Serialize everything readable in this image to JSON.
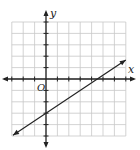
{
  "graph": {
    "x_axis_label": "x",
    "y_axis_label": "y",
    "origin_label": "O",
    "x_range": [
      -3,
      7
    ],
    "y_range": [
      -5,
      5
    ],
    "grid_unit": 1,
    "line": {
      "equation": "y = (2/3)x - 3",
      "slope": 0.6667,
      "y_intercept": -3,
      "x_intercept": 4.5,
      "start": [
        -2.9,
        -4.93
      ],
      "end": [
        7,
        1.67
      ]
    }
  },
  "chart_data": {
    "type": "line",
    "title": "",
    "xlabel": "x",
    "ylabel": "y",
    "xlim": [
      -3,
      7
    ],
    "ylim": [
      -5,
      5
    ],
    "grid": true,
    "series": [
      {
        "name": "line",
        "x": [
          -2.9,
          0,
          4.5,
          7
        ],
        "y": [
          -4.93,
          -3,
          0,
          1.67
        ]
      }
    ]
  }
}
